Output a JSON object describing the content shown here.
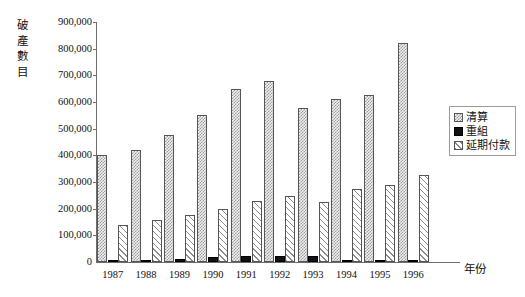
{
  "chart_data": {
    "type": "bar",
    "title": "",
    "subtitle": "",
    "ylabel": "破產數目",
    "xlabel": "年份",
    "categories": [
      "1987",
      "1988",
      "1989",
      "1990",
      "1991",
      "1992",
      "1993",
      "1994",
      "1995",
      "1996"
    ],
    "series": [
      {
        "name": "清算",
        "values": [
          400000,
          420000,
          475000,
          552000,
          650000,
          677000,
          578000,
          611000,
          627000,
          820000
        ]
      },
      {
        "name": "重組",
        "values": [
          8000,
          5000,
          10000,
          20000,
          23000,
          24000,
          24000,
          7000,
          6000,
          6000
        ]
      },
      {
        "name": "延期付款",
        "values": [
          137000,
          157000,
          178000,
          200000,
          227000,
          246000,
          224000,
          275000,
          288000,
          326000
        ]
      }
    ],
    "ylim": [
      0,
      900000
    ],
    "ytick_values": [
      0,
      100000,
      200000,
      300000,
      400000,
      500000,
      600000,
      700000,
      800000,
      900000
    ],
    "ytick_labels": [
      "0",
      "100,000",
      "200,000",
      "300,000",
      "400,000",
      "500,000",
      "600,000",
      "700,000",
      "800,000",
      "900,000"
    ],
    "grid": false,
    "legend_position": "right",
    "legend": [
      {
        "label": "清算",
        "swatch": "checkered-grey"
      },
      {
        "label": "重組",
        "swatch": "solid-black"
      },
      {
        "label": "延期付款",
        "swatch": "diagonal-hatch"
      }
    ]
  },
  "colors": {
    "axis": "#6d6d6d",
    "text": "#111111",
    "series_liquidation": "#9a9a9a",
    "series_reorganization": "#111111",
    "series_deferred": "#8c8c8c",
    "background": "#ffffff",
    "legend_border": "#9b9b9b"
  }
}
